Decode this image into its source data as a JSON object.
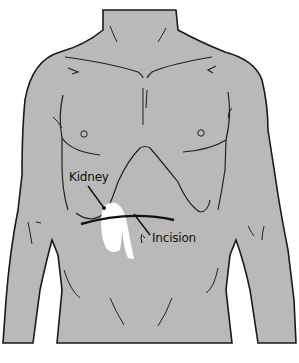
{
  "figure": {
    "colors": {
      "skin": "#b9b9b9",
      "outline": "#1a1a1a",
      "kidney": "#ffffff",
      "background": "#ffffff"
    },
    "labels": {
      "kidney": "Kidney",
      "incision": "Incision"
    }
  }
}
